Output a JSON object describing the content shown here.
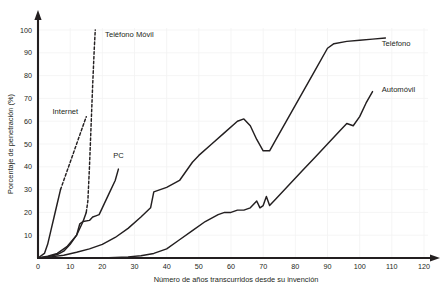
{
  "chart_data": {
    "type": "line",
    "title": "",
    "subtitle": "",
    "xlabel": "Número de años transcurridos desde su invención",
    "ylabel": "Porcentaje de penetración (%)",
    "xlim": [
      0,
      120
    ],
    "ylim": [
      0,
      103
    ],
    "xticks": [
      0,
      10,
      20,
      30,
      40,
      50,
      60,
      70,
      80,
      90,
      100,
      110,
      120
    ],
    "yticks": [
      10,
      20,
      30,
      40,
      50,
      60,
      70,
      80,
      90,
      100
    ],
    "xtick_labels": [
      "0",
      "10",
      "20",
      "30",
      "40",
      "50",
      "60",
      "70",
      "80",
      "90",
      "100",
      "110",
      "120"
    ],
    "ytick_labels": [
      "10",
      "20",
      "30",
      "40",
      "50",
      "60",
      "70",
      "80",
      "90",
      "100"
    ],
    "grid": true,
    "grid_color": "#f2f2f2",
    "line_color": "#231f20",
    "legend_position": "inline-annotations",
    "series": [
      {
        "name": "Teléfono",
        "style": "solid",
        "label_x": 105,
        "label_y": 93,
        "points": [
          [
            0,
            0
          ],
          [
            4,
            0.5
          ],
          [
            8,
            1.2
          ],
          [
            12,
            2.5
          ],
          [
            16,
            4
          ],
          [
            20,
            6
          ],
          [
            24,
            9
          ],
          [
            28,
            13
          ],
          [
            32,
            18
          ],
          [
            35,
            22
          ],
          [
            36,
            29
          ],
          [
            40,
            31
          ],
          [
            44,
            34
          ],
          [
            48,
            42
          ],
          [
            50,
            45
          ],
          [
            54,
            50
          ],
          [
            58,
            55
          ],
          [
            62,
            60
          ],
          [
            64,
            61
          ],
          [
            66,
            58
          ],
          [
            68,
            52
          ],
          [
            70,
            47
          ],
          [
            72,
            47
          ],
          [
            74,
            52
          ],
          [
            78,
            62
          ],
          [
            82,
            72
          ],
          [
            86,
            82
          ],
          [
            90,
            92
          ],
          [
            92,
            94
          ],
          [
            96,
            95
          ],
          [
            100,
            95.5
          ],
          [
            104,
            96
          ],
          [
            108,
            96.5
          ]
        ]
      },
      {
        "name": "Automóvil",
        "style": "solid",
        "label_x": 105,
        "label_y": 73,
        "points": [
          [
            0,
            0
          ],
          [
            20,
            0
          ],
          [
            28,
            0.5
          ],
          [
            32,
            1
          ],
          [
            36,
            2
          ],
          [
            40,
            4
          ],
          [
            44,
            8
          ],
          [
            48,
            12
          ],
          [
            52,
            16
          ],
          [
            56,
            19
          ],
          [
            58,
            20
          ],
          [
            60,
            20
          ],
          [
            62,
            21
          ],
          [
            64,
            21
          ],
          [
            66,
            22
          ],
          [
            68,
            25
          ],
          [
            69,
            22
          ],
          [
            70,
            23
          ],
          [
            71,
            27
          ],
          [
            72,
            23
          ],
          [
            74,
            26
          ],
          [
            78,
            32
          ],
          [
            82,
            38
          ],
          [
            86,
            44
          ],
          [
            90,
            50
          ],
          [
            94,
            56
          ],
          [
            96,
            59
          ],
          [
            98,
            58
          ],
          [
            100,
            62
          ],
          [
            102,
            68
          ],
          [
            104,
            73
          ]
        ]
      },
      {
        "name": "PC",
        "style": "solid",
        "label_x": 25,
        "label_y": 44,
        "points": [
          [
            0,
            0
          ],
          [
            3,
            0.5
          ],
          [
            6,
            1.5
          ],
          [
            8,
            3
          ],
          [
            10,
            6
          ],
          [
            12,
            10
          ],
          [
            13,
            15
          ],
          [
            14,
            16
          ],
          [
            16,
            16.5
          ],
          [
            17,
            18
          ],
          [
            18,
            18.5
          ],
          [
            19,
            19
          ],
          [
            20,
            22
          ],
          [
            22,
            28
          ],
          [
            24,
            34
          ],
          [
            25,
            39
          ]
        ]
      },
      {
        "name": "Internet",
        "style": "mixed",
        "label_x": 8.5,
        "label_y": 63,
        "solid_points": [
          [
            0,
            0
          ],
          [
            2,
            2
          ],
          [
            3,
            6
          ],
          [
            4,
            12
          ],
          [
            5,
            18
          ],
          [
            6,
            24
          ],
          [
            7,
            30
          ]
        ],
        "dashed_points": [
          [
            7,
            30
          ],
          [
            9,
            38
          ],
          [
            11,
            46
          ],
          [
            13,
            54
          ],
          [
            15,
            62
          ]
        ]
      },
      {
        "name": "Teléfono Móvil",
        "style": "mixed",
        "label_x": 19,
        "label_y": 97,
        "solid_points": [
          [
            0,
            0
          ],
          [
            3,
            0.8
          ],
          [
            6,
            2
          ],
          [
            9,
            5
          ],
          [
            12,
            10
          ],
          [
            14,
            16
          ],
          [
            15,
            20
          ]
        ],
        "dashed_points": [
          [
            15,
            20
          ],
          [
            15.5,
            25
          ],
          [
            16,
            40
          ],
          [
            16.5,
            58
          ],
          [
            17,
            76
          ],
          [
            17.5,
            92
          ],
          [
            17.8,
            100
          ]
        ]
      }
    ],
    "series_labels": [
      {
        "name": "Teléfono",
        "text": "Teléfono"
      },
      {
        "name": "Automóvil",
        "text": "Automóvil"
      },
      {
        "name": "PC",
        "text": "PC"
      },
      {
        "name": "Internet",
        "text": "Internet"
      },
      {
        "name": "Teléfono Móvil",
        "text": "Teléfono Móvil"
      }
    ]
  }
}
